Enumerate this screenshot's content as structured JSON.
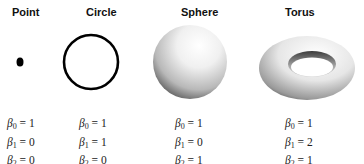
{
  "columns": [
    {
      "title": "Point",
      "shape": "point-glyph",
      "betas": [
        {
          "label": "β",
          "sub": "0",
          "value": "1"
        },
        {
          "label": "β",
          "sub": "1",
          "value": "0"
        },
        {
          "label": "β",
          "sub": "2",
          "value": "0"
        }
      ]
    },
    {
      "title": "Circle",
      "shape": "circle-glyph",
      "betas": [
        {
          "label": "β",
          "sub": "0",
          "value": "1"
        },
        {
          "label": "β",
          "sub": "1",
          "value": "1"
        },
        {
          "label": "β",
          "sub": "2",
          "value": "0"
        }
      ]
    },
    {
      "title": "Sphere",
      "shape": "sphere-glyph",
      "betas": [
        {
          "label": "β",
          "sub": "0",
          "value": "1"
        },
        {
          "label": "β",
          "sub": "1",
          "value": "0"
        },
        {
          "label": "β",
          "sub": "2",
          "value": "1"
        }
      ]
    },
    {
      "title": "Torus",
      "shape": "torus-glyph",
      "betas": [
        {
          "label": "β",
          "sub": "0",
          "value": "1"
        },
        {
          "label": "β",
          "sub": "1",
          "value": "2"
        },
        {
          "label": "β",
          "sub": "2",
          "value": "1"
        }
      ]
    }
  ],
  "equals": "="
}
